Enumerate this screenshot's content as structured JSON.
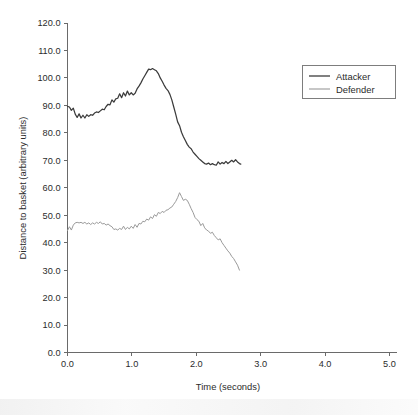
{
  "chart_data": {
    "type": "line",
    "title": "",
    "xlabel": "Time (seconds)",
    "ylabel": "Distance to basket (arbitrary units)",
    "xlim": [
      0.0,
      5.0
    ],
    "ylim": [
      0.0,
      120.0
    ],
    "xticks": [
      "0.0",
      "1.0",
      "2.0",
      "3.0",
      "4.0",
      "5.0"
    ],
    "yticks": [
      "0.0",
      "10.0",
      "20.0",
      "30.0",
      "40.0",
      "50.0",
      "60.0",
      "70.0",
      "80.0",
      "90.0",
      "100.0",
      "110.0",
      "120.0"
    ],
    "grid": false,
    "legend_position": "upper right",
    "legend_entries": [
      "Attacker",
      "Defender"
    ],
    "colors": {
      "attacker": "#3b3b3b",
      "defender": "#9a9a9a",
      "axis": "#6a6a6a",
      "text": "#2b2b2b"
    },
    "series": [
      {
        "name": "Attacker",
        "color": "#3b3b3b",
        "x": [
          0.0,
          0.03,
          0.06,
          0.09,
          0.12,
          0.15,
          0.18,
          0.21,
          0.24,
          0.27,
          0.3,
          0.33,
          0.36,
          0.39,
          0.42,
          0.45,
          0.48,
          0.51,
          0.54,
          0.57,
          0.6,
          0.63,
          0.66,
          0.69,
          0.72,
          0.75,
          0.78,
          0.81,
          0.84,
          0.87,
          0.9,
          0.93,
          0.96,
          0.99,
          1.02,
          1.05,
          1.08,
          1.11,
          1.14,
          1.17,
          1.2,
          1.23,
          1.26,
          1.29,
          1.32,
          1.35,
          1.38,
          1.41,
          1.44,
          1.47,
          1.5,
          1.53,
          1.56,
          1.59,
          1.62,
          1.65,
          1.68,
          1.71,
          1.74,
          1.77,
          1.8,
          1.83,
          1.86,
          1.89,
          1.92,
          1.95,
          1.98,
          2.01,
          2.04,
          2.07,
          2.1,
          2.13,
          2.16,
          2.19,
          2.22,
          2.25,
          2.28,
          2.31,
          2.34,
          2.37,
          2.4,
          2.43,
          2.46,
          2.49,
          2.52,
          2.55,
          2.58,
          2.61,
          2.64,
          2.67,
          2.69
        ],
        "y": [
          89.6,
          89.4,
          88.2,
          89.0,
          86.8,
          85.6,
          86.9,
          85.4,
          86.4,
          85.4,
          86.6,
          86.0,
          86.6,
          86.4,
          87.2,
          87.6,
          87.4,
          88.0,
          88.6,
          88.4,
          89.6,
          90.4,
          90.2,
          92.0,
          91.2,
          92.4,
          92.6,
          94.2,
          92.8,
          94.6,
          93.4,
          95.2,
          93.8,
          94.6,
          93.8,
          94.4,
          96.0,
          97.0,
          98.2,
          99.6,
          100.8,
          102.0,
          103.2,
          103.0,
          103.4,
          103.0,
          102.6,
          101.6,
          100.0,
          98.8,
          97.4,
          96.2,
          95.4,
          94.0,
          92.0,
          89.4,
          86.8,
          84.0,
          82.6,
          80.2,
          78.6,
          77.2,
          75.8,
          74.8,
          74.2,
          73.0,
          72.2,
          71.4,
          70.6,
          70.0,
          69.4,
          68.8,
          68.6,
          69.0,
          68.4,
          68.8,
          68.4,
          68.2,
          69.4,
          68.6,
          69.2,
          68.8,
          69.6,
          68.8,
          69.4,
          70.0,
          69.4,
          70.2,
          69.4,
          68.8,
          68.6
        ]
      },
      {
        "name": "Defender",
        "color": "#9a9a9a",
        "x": [
          0.0,
          0.03,
          0.06,
          0.09,
          0.12,
          0.15,
          0.18,
          0.21,
          0.24,
          0.27,
          0.3,
          0.33,
          0.36,
          0.39,
          0.42,
          0.45,
          0.48,
          0.51,
          0.54,
          0.57,
          0.6,
          0.63,
          0.66,
          0.69,
          0.72,
          0.75,
          0.78,
          0.81,
          0.84,
          0.87,
          0.9,
          0.93,
          0.96,
          0.99,
          1.02,
          1.05,
          1.08,
          1.11,
          1.14,
          1.17,
          1.2,
          1.23,
          1.26,
          1.29,
          1.32,
          1.35,
          1.38,
          1.41,
          1.44,
          1.47,
          1.5,
          1.53,
          1.56,
          1.59,
          1.62,
          1.65,
          1.68,
          1.71,
          1.74,
          1.77,
          1.8,
          1.83,
          1.86,
          1.89,
          1.92,
          1.95,
          1.98,
          2.01,
          2.04,
          2.07,
          2.1,
          2.13,
          2.16,
          2.19,
          2.22,
          2.25,
          2.28,
          2.31,
          2.34,
          2.37,
          2.4,
          2.43,
          2.46,
          2.49,
          2.52,
          2.55,
          2.58,
          2.61,
          2.64,
          2.67
        ],
        "y": [
          44.4,
          45.8,
          44.6,
          46.4,
          47.2,
          47.4,
          47.2,
          47.4,
          47.0,
          47.4,
          46.8,
          47.2,
          46.6,
          47.2,
          46.8,
          47.4,
          47.0,
          47.6,
          46.8,
          47.0,
          46.4,
          46.8,
          46.2,
          45.8,
          44.8,
          45.0,
          44.6,
          45.2,
          44.8,
          46.0,
          44.8,
          45.6,
          45.0,
          46.0,
          45.2,
          46.6,
          45.6,
          47.0,
          46.8,
          47.8,
          47.6,
          48.6,
          48.2,
          49.4,
          48.8,
          50.2,
          49.6,
          51.0,
          50.6,
          51.4,
          51.0,
          51.8,
          52.0,
          52.6,
          53.0,
          54.0,
          55.0,
          56.4,
          58.2,
          56.8,
          55.4,
          55.8,
          55.4,
          54.0,
          52.4,
          51.0,
          49.2,
          48.4,
          47.8,
          46.2,
          47.0,
          45.4,
          44.6,
          44.2,
          43.4,
          43.8,
          42.6,
          41.8,
          41.0,
          41.4,
          40.0,
          39.0,
          38.0,
          37.0,
          36.2,
          35.0,
          34.2,
          33.0,
          31.8,
          30.0
        ]
      }
    ]
  },
  "axes": {
    "y_tick_values": [
      0,
      10,
      20,
      30,
      40,
      50,
      60,
      70,
      80,
      90,
      100,
      110,
      120
    ],
    "x_tick_values": [
      0,
      1,
      2,
      3,
      4,
      5
    ]
  }
}
